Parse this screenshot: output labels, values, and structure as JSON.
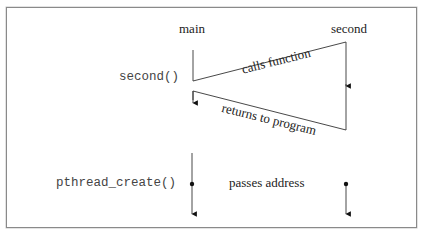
{
  "diagram": {
    "participants": {
      "main": "main",
      "second": "second"
    },
    "calls": {
      "second_call": "second()",
      "pthread_call": "pthread_create()"
    },
    "messages": {
      "calls_function": "calls function",
      "returns_to_program": "returns to program",
      "passes_address": "passes address"
    },
    "colors": {
      "line": "#222222",
      "frame": "#8a8a8a"
    }
  }
}
